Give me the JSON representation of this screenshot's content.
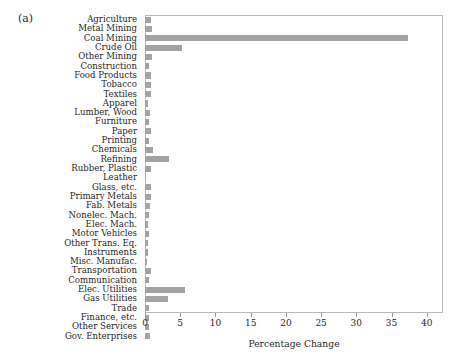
{
  "figure": {
    "panel_label": "(a)",
    "background": "#ffffff",
    "bar_color": "#a3a3a3",
    "frame_color": "#b9b9b9"
  },
  "chart_data": {
    "type": "bar",
    "orientation": "horizontal",
    "title": "",
    "subtitle": "",
    "xlabel": "Percentage Change",
    "ylabel": "",
    "xlim": [
      0,
      42.3
    ],
    "ylim": null,
    "grid": false,
    "legend": null,
    "xticks": [
      0,
      5,
      10,
      15,
      20,
      25,
      30,
      35,
      40
    ],
    "xtick_labels": [
      "0",
      "5",
      "10",
      "15",
      "20",
      "25",
      "30",
      "35",
      "40"
    ],
    "categories": [
      "Agriculture",
      "Metal Mining",
      "Coal Mining",
      "Crude Oil",
      "Other Mining",
      "Construction",
      "Food Products",
      "Tobacco",
      "Textiles",
      "Apparel",
      "Lumber, Wood",
      "Furniture",
      "Paper",
      "Printing",
      "Chemicals",
      "Refining",
      "Rubber, Plastic",
      "Leather",
      "Glass, etc.",
      "Primary Metals",
      "Fab. Metals",
      "Nonelec. Mach.",
      "Elec. Mach.",
      "Motor Vehicles",
      "Other Trans. Eq.",
      "Instruments",
      "Misc. Manufac.",
      "Transportation",
      "Communication",
      "Elec. Utilities",
      "Gas Utilities",
      "Trade",
      "Finance, etc.",
      "Other Services",
      "Gov. Enterprises"
    ],
    "values": [
      0.9,
      1.0,
      37.3,
      5.2,
      1.0,
      0.6,
      0.8,
      0.9,
      0.9,
      0.4,
      0.7,
      0.5,
      0.8,
      0.5,
      1.1,
      3.4,
      0.9,
      0.2,
      0.9,
      0.9,
      0.7,
      0.6,
      0.4,
      0.5,
      0.4,
      0.4,
      0.3,
      0.8,
      0.6,
      5.7,
      3.3,
      0.6,
      0.5,
      0.5,
      0.7
    ]
  }
}
